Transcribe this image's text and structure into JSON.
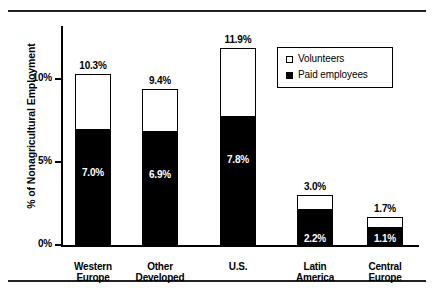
{
  "chart_data": {
    "type": "bar",
    "subtype": "stacked",
    "title": "",
    "xlabel": "",
    "ylabel": "% of Nonagricultural Employment",
    "ylim": [
      0,
      13
    ],
    "ytick_values": [
      0,
      5,
      10
    ],
    "ytick_labels": [
      "0%",
      "5%",
      "10%"
    ],
    "grid": false,
    "legend_position": "top-right",
    "categories": [
      "Western Europe",
      "Other Developed",
      "U.S.",
      "Latin America",
      "Central Europe"
    ],
    "category_lines": [
      [
        "Western",
        "Europe"
      ],
      [
        "Other",
        "Developed"
      ],
      [
        "U.S."
      ],
      [
        "Latin",
        "America"
      ],
      [
        "Central",
        "Europe"
      ]
    ],
    "series": [
      {
        "name": "Paid employees",
        "color": "#000000",
        "values": [
          7.0,
          6.9,
          7.8,
          2.2,
          1.1
        ],
        "labels": [
          "7.0%",
          "6.9%",
          "7.8%",
          "2.2%",
          "1.1%"
        ]
      },
      {
        "name": "Volunteers",
        "color": "#ffffff",
        "values": [
          3.3,
          2.5,
          4.1,
          0.8,
          0.6
        ],
        "labels": [
          "",
          "",
          "",
          "",
          ""
        ]
      }
    ],
    "totals": [
      10.3,
      9.4,
      11.9,
      3.0,
      1.7
    ],
    "total_labels": [
      "10.3%",
      "9.4%",
      "11.9%",
      "3.0%",
      "1.7%"
    ]
  },
  "legend": {
    "items": [
      {
        "label": "Volunteers",
        "swatch": "open-square"
      },
      {
        "label": "Paid employees",
        "swatch": "filled-square"
      }
    ]
  },
  "axis": {
    "y_title": "% of Nonagricultural Employment",
    "ticks": [
      {
        "label": "10%",
        "value": 10
      },
      {
        "label": "5%",
        "value": 5
      },
      {
        "label": "0%",
        "value": 0
      }
    ]
  },
  "colors": {
    "paid": "#000000",
    "volunteers": "#ffffff",
    "axis": "#000000",
    "rule": "#222222",
    "background": "#ffffff"
  }
}
